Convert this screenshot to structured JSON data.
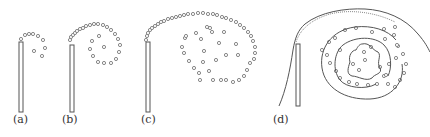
{
  "figure": {
    "panels": [
      {
        "id": "a",
        "label": "(a)",
        "label_x": 13
      },
      {
        "id": "b",
        "label": "(b)",
        "label_x": 62
      },
      {
        "id": "c",
        "label": "(c)",
        "label_x": 141
      },
      {
        "id": "d",
        "label": "(d)",
        "label_x": 273
      }
    ],
    "colors": {
      "rod": "#555555",
      "dot": "#888888",
      "curve": "#555555"
    },
    "rods": [
      {
        "x": 19,
        "y": 42,
        "w": 4,
        "h": 70
      },
      {
        "x": 70,
        "y": 45,
        "w": 4,
        "h": 67
      },
      {
        "x": 146,
        "y": 42,
        "w": 4,
        "h": 70
      },
      {
        "x": 296,
        "y": 44,
        "w": 4,
        "h": 62
      }
    ],
    "dots": {
      "a": [
        [
          21,
          39
        ],
        [
          25,
          35
        ],
        [
          29,
          34
        ],
        [
          33,
          34
        ],
        [
          38,
          36
        ],
        [
          43,
          40
        ],
        [
          45,
          48
        ],
        [
          42,
          56
        ],
        [
          34,
          51
        ]
      ],
      "b": [
        [
          70,
          40
        ],
        [
          71,
          37
        ],
        [
          73,
          35
        ],
        [
          75,
          33
        ],
        [
          77,
          31
        ],
        [
          80,
          29
        ],
        [
          83,
          28
        ],
        [
          86,
          26
        ],
        [
          90,
          25
        ],
        [
          94,
          24
        ],
        [
          98,
          24
        ],
        [
          103,
          25
        ],
        [
          107,
          27
        ],
        [
          111,
          30
        ],
        [
          115,
          34
        ],
        [
          118,
          39
        ],
        [
          120,
          45
        ],
        [
          119,
          52
        ],
        [
          116,
          59
        ],
        [
          111,
          63
        ],
        [
          104,
          63
        ],
        [
          98,
          62
        ],
        [
          93,
          56
        ],
        [
          90,
          49
        ],
        [
          92,
          41
        ],
        [
          99,
          36
        ],
        [
          104,
          47
        ]
      ],
      "c": [
        [
          146,
          40
        ],
        [
          147,
          36
        ],
        [
          148,
          33
        ],
        [
          150,
          30
        ],
        [
          152,
          28
        ],
        [
          155,
          26
        ],
        [
          158,
          24
        ],
        [
          161,
          22
        ],
        [
          164,
          21
        ],
        [
          168,
          19
        ],
        [
          172,
          18
        ],
        [
          176,
          17
        ],
        [
          180,
          16
        ],
        [
          184,
          15
        ],
        [
          188,
          14
        ],
        [
          193,
          14
        ],
        [
          198,
          13
        ],
        [
          203,
          13
        ],
        [
          208,
          14
        ],
        [
          213,
          14
        ],
        [
          217,
          15
        ],
        [
          222,
          17
        ],
        [
          226,
          18
        ],
        [
          231,
          20
        ],
        [
          236,
          22
        ],
        [
          240,
          25
        ],
        [
          244,
          28
        ],
        [
          248,
          32
        ],
        [
          251,
          36
        ],
        [
          253,
          41
        ],
        [
          255,
          47
        ],
        [
          255,
          53
        ],
        [
          254,
          59
        ],
        [
          250,
          63
        ],
        [
          247,
          70
        ],
        [
          244,
          76
        ],
        [
          239,
          80
        ],
        [
          233,
          82
        ],
        [
          226,
          80
        ],
        [
          221,
          80
        ],
        [
          213,
          80
        ],
        [
          200,
          80
        ],
        [
          199,
          73
        ],
        [
          194,
          68
        ],
        [
          189,
          61
        ],
        [
          184,
          53
        ],
        [
          182,
          47
        ],
        [
          185,
          38
        ],
        [
          186,
          36
        ],
        [
          196,
          33
        ],
        [
          207,
          27
        ],
        [
          212,
          32
        ],
        [
          219,
          43
        ],
        [
          224,
          32
        ],
        [
          236,
          44
        ],
        [
          238,
          55
        ],
        [
          226,
          55
        ],
        [
          216,
          60
        ],
        [
          209,
          71
        ],
        [
          203,
          62
        ],
        [
          204,
          51
        ],
        [
          201,
          39
        ],
        [
          210,
          28
        ]
      ]
    },
    "d_dots": [
      [
        322,
        50
      ],
      [
        329,
        42
      ],
      [
        345,
        30
      ],
      [
        356,
        28
      ],
      [
        372,
        32
      ],
      [
        385,
        39
      ],
      [
        394,
        35
      ],
      [
        398,
        46
      ],
      [
        403,
        54
      ],
      [
        406,
        64
      ],
      [
        404,
        73
      ],
      [
        400,
        80
      ],
      [
        395,
        87
      ],
      [
        388,
        84
      ],
      [
        384,
        76
      ],
      [
        377,
        84
      ],
      [
        368,
        85
      ],
      [
        357,
        84
      ],
      [
        349,
        82
      ],
      [
        340,
        78
      ],
      [
        336,
        71
      ],
      [
        330,
        63
      ],
      [
        327,
        55
      ],
      [
        335,
        38
      ],
      [
        384,
        29
      ],
      [
        395,
        27
      ],
      [
        397,
        45
      ],
      [
        396,
        58
      ],
      [
        359,
        70
      ],
      [
        364,
        52
      ],
      [
        371,
        47
      ],
      [
        353,
        64
      ],
      [
        380,
        67
      ],
      [
        389,
        64
      ],
      [
        386,
        75
      ],
      [
        340,
        50
      ],
      [
        365,
        60
      ]
    ]
  }
}
